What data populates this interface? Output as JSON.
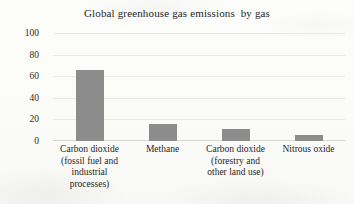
{
  "chart_data": {
    "type": "bar",
    "title": "Global greenhouse gas emissions  by gas",
    "xlabel": "",
    "ylabel": "Percentage, %",
    "ylim": [
      0,
      100
    ],
    "yticks": [
      0,
      20,
      40,
      60,
      80,
      100
    ],
    "ytick_labels": [
      "0",
      "20",
      "40",
      "60",
      "80",
      "100"
    ],
    "grid": true,
    "legend": "none",
    "bar_color": "#8c8c8c",
    "categories": [
      "Carbon dioxide (fossil fuel and industrial processes)",
      "Methane",
      "Carbon dioxide (forestry and other land use)",
      "Nitrous oxide"
    ],
    "category_lines": [
      [
        "Carbon dioxide",
        "(fossil fuel and",
        "industrial",
        "processes)"
      ],
      [
        "Methane"
      ],
      [
        "Carbon dioxide",
        "(forestry and",
        "other land use)"
      ],
      [
        "Nitrous oxide"
      ]
    ],
    "values": [
      66,
      16,
      11,
      6
    ]
  }
}
